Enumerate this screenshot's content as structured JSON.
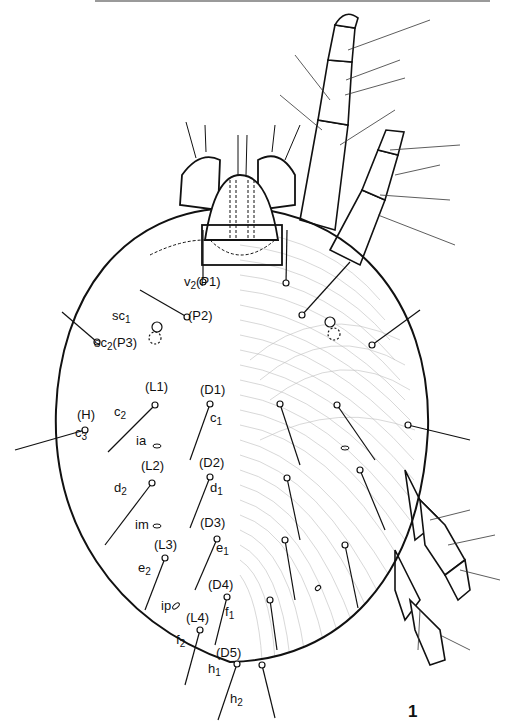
{
  "figure": {
    "number": "1",
    "colors": {
      "ink": "#111111",
      "paper": "#ffffff",
      "striation": "#bdbdbd"
    }
  },
  "labels": {
    "setae": [
      {
        "base": "v",
        "sub": "2",
        "code": "(P1)",
        "x": 184,
        "y": 282
      },
      {
        "base": "sc",
        "sub": "1",
        "code": "",
        "x": 112,
        "y": 316
      },
      {
        "base": "",
        "sub": "",
        "code": "(P2)",
        "x": 188,
        "y": 316
      },
      {
        "base": "sc",
        "sub": "2",
        "code": "(P3)",
        "x": 94,
        "y": 343
      },
      {
        "base": "",
        "sub": "",
        "code": "(L1)",
        "x": 145,
        "y": 387
      },
      {
        "base": "",
        "sub": "",
        "code": "(D1)",
        "x": 200,
        "y": 390
      },
      {
        "base": "c",
        "sub": "2",
        "code": "",
        "x": 114,
        "y": 412
      },
      {
        "base": "c",
        "sub": "1",
        "code": "",
        "x": 210,
        "y": 418
      },
      {
        "base": "",
        "sub": "",
        "code": "(H)",
        "x": 77,
        "y": 415
      },
      {
        "base": "c",
        "sub": "3",
        "code": "",
        "x": 75,
        "y": 433
      },
      {
        "base": "",
        "sub": "",
        "code": "(L2)",
        "x": 141,
        "y": 466
      },
      {
        "base": "",
        "sub": "",
        "code": "(D2)",
        "x": 199,
        "y": 463
      },
      {
        "base": "d",
        "sub": "2",
        "code": "",
        "x": 114,
        "y": 488
      },
      {
        "base": "d",
        "sub": "1",
        "code": "",
        "x": 210,
        "y": 488
      },
      {
        "base": "",
        "sub": "",
        "code": "(D3)",
        "x": 200,
        "y": 523
      },
      {
        "base": "",
        "sub": "",
        "code": "(L3)",
        "x": 154,
        "y": 545
      },
      {
        "base": "e",
        "sub": "1",
        "code": "",
        "x": 216,
        "y": 548
      },
      {
        "base": "e",
        "sub": "2",
        "code": "",
        "x": 138,
        "y": 568
      },
      {
        "base": "",
        "sub": "",
        "code": "(D4)",
        "x": 208,
        "y": 585
      },
      {
        "base": "",
        "sub": "",
        "code": "(L4)",
        "x": 186,
        "y": 618
      },
      {
        "base": "f",
        "sub": "1",
        "code": "",
        "x": 225,
        "y": 612
      },
      {
        "base": "f",
        "sub": "2",
        "code": "",
        "x": 176,
        "y": 640
      },
      {
        "base": "",
        "sub": "",
        "code": "(D5)",
        "x": 216,
        "y": 653
      },
      {
        "base": "h",
        "sub": "1",
        "code": "",
        "x": 208,
        "y": 669
      },
      {
        "base": "h",
        "sub": "2",
        "code": "",
        "x": 230,
        "y": 699
      }
    ],
    "pores": [
      {
        "text": "ia",
        "x": 136,
        "y": 441
      },
      {
        "text": "im",
        "x": 135,
        "y": 525
      },
      {
        "text": "ip",
        "x": 161,
        "y": 606
      }
    ]
  }
}
